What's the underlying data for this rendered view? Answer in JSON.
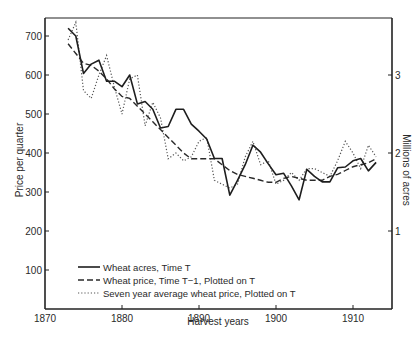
{
  "chart_data": {
    "type": "line",
    "title": "",
    "xlabel": "Harvest years",
    "ylabel": "Price per quarter",
    "ylabel_right": "Millions of acres",
    "xlim": [
      1870,
      1915
    ],
    "ylim": [
      0,
      740
    ],
    "ylim_right": [
      0,
      3.7
    ],
    "x_ticks": [
      1870,
      1880,
      1890,
      1900,
      1910
    ],
    "y_ticks": [
      100,
      200,
      300,
      400,
      500,
      600,
      700
    ],
    "y_ticks_right": [
      1,
      2,
      3
    ],
    "grid": false,
    "legend_position": "lower left",
    "x": [
      1873,
      1874,
      1875,
      1876,
      1877,
      1878,
      1879,
      1880,
      1881,
      1882,
      1883,
      1884,
      1885,
      1886,
      1887,
      1888,
      1889,
      1890,
      1891,
      1892,
      1893,
      1894,
      1895,
      1896,
      1897,
      1898,
      1899,
      1900,
      1901,
      1902,
      1903,
      1904,
      1905,
      1906,
      1907,
      1908,
      1909,
      1910,
      1911,
      1912,
      1913
    ],
    "series": [
      {
        "name": "Wheat acres, Time T",
        "style": "solid",
        "axis": "right",
        "unit": "millions of acres",
        "values": [
          3.6,
          3.5,
          3.02,
          3.14,
          3.19,
          2.92,
          2.92,
          2.85,
          3.0,
          2.63,
          2.66,
          2.56,
          2.32,
          2.34,
          2.56,
          2.56,
          2.37,
          2.28,
          2.18,
          1.93,
          1.93,
          1.46,
          1.65,
          1.85,
          2.1,
          2.01,
          1.86,
          1.72,
          1.74,
          1.58,
          1.4,
          1.79,
          1.7,
          1.63,
          1.63,
          1.81,
          1.82,
          1.9,
          1.93,
          1.77,
          1.88
        ]
      },
      {
        "name": "Wheat price, Time T-1, Plotted on T",
        "style": "dashed",
        "axis": "left",
        "unit": "price per quarter",
        "values": [
          680,
          655,
          630,
          625,
          610,
          590,
          565,
          545,
          540,
          520,
          500,
          480,
          460,
          440,
          420,
          400,
          385,
          385,
          385,
          385,
          370,
          355,
          345,
          340,
          335,
          330,
          325,
          325,
          335,
          340,
          335,
          330,
          330,
          330,
          340,
          345,
          355,
          365,
          370,
          375,
          385
        ]
      },
      {
        "name": "Seven year average wheat price, Plotted on T",
        "style": "dotted",
        "axis": "left",
        "unit": "price per quarter",
        "values": [
          690,
          735,
          560,
          540,
          600,
          650,
          570,
          500,
          590,
          600,
          470,
          530,
          490,
          385,
          400,
          380,
          390,
          430,
          440,
          330,
          320,
          310,
          320,
          390,
          430,
          370,
          380,
          320,
          330,
          350,
          330,
          360,
          360,
          350,
          340,
          380,
          430,
          400,
          360,
          420,
          390
        ]
      }
    ]
  },
  "legend": {
    "items": [
      {
        "label": "Wheat acres, Time T",
        "style": "solid"
      },
      {
        "label": "Wheat price, Time T−1, Plotted on T",
        "style": "dashed"
      },
      {
        "label": "Seven year average wheat price, Plotted on T",
        "style": "dotted"
      }
    ]
  },
  "axes": {
    "x_title": "Harvest years",
    "y_left_title": "Price per quarter",
    "y_right_title": "Millions of acres"
  }
}
